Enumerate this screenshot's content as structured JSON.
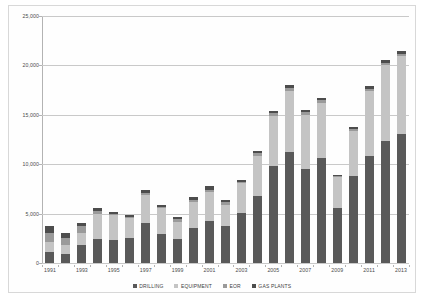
{
  "chart_data": {
    "type": "bar",
    "subtype": "stacked-column",
    "title": "",
    "subtitle": "",
    "xlabel": "",
    "ylabel": "",
    "ylim": [
      0,
      25000
    ],
    "ytick_labels": [
      "0",
      "5,000",
      "10,000",
      "15,000",
      "20,000",
      "25,000"
    ],
    "ytick_values": [
      0,
      5000,
      10000,
      15000,
      20000,
      25000
    ],
    "grid": true,
    "legend_position": "bottom",
    "categories": [
      "1991",
      "1992",
      "1993",
      "1994",
      "1995",
      "1996",
      "1997",
      "1998",
      "1999",
      "2000",
      "2001",
      "2002",
      "2003",
      "2004",
      "2005",
      "2006",
      "2007",
      "2008",
      "2009",
      "2010",
      "2011",
      "2012",
      "2013"
    ],
    "xtick_labels_shown": [
      "1991",
      "1993",
      "1995",
      "1997",
      "1999",
      "2001",
      "2003",
      "2005",
      "2007",
      "2009",
      "2011",
      "2013"
    ],
    "series": [
      {
        "name": "DRILLING",
        "color": "#595959",
        "values": [
          1100,
          900,
          1800,
          2400,
          2300,
          2500,
          4100,
          2900,
          2450,
          3500,
          4300,
          3700,
          5100,
          6800,
          9800,
          11200,
          9500,
          10600,
          5600,
          8800,
          10800,
          12300,
          13100
        ]
      },
      {
        "name": "EQUIPMENT",
        "color": "#c4c4c4",
        "values": [
          1000,
          900,
          1200,
          2600,
          2600,
          2100,
          2800,
          2700,
          1750,
          2700,
          2900,
          2200,
          3000,
          4000,
          5100,
          6200,
          5500,
          5600,
          3100,
          4600,
          6600,
          7700,
          7900
        ]
      },
      {
        "name": "EOR",
        "color": "#9a9a9a",
        "values": [
          900,
          700,
          700,
          300,
          100,
          100,
          200,
          100,
          250,
          200,
          200,
          250,
          100,
          300,
          250,
          300,
          300,
          300,
          100,
          200,
          200,
          200,
          200
        ]
      },
      {
        "name": "GAS PLANTS",
        "color": "#4d4d4d",
        "values": [
          700,
          500,
          400,
          300,
          200,
          200,
          300,
          200,
          250,
          300,
          350,
          250,
          200,
          200,
          250,
          300,
          200,
          200,
          100,
          200,
          300,
          300,
          300
        ]
      }
    ],
    "totals": [
      3700,
      3000,
      4100,
      5600,
      5200,
      4900,
      7400,
      5900,
      4700,
      6700,
      7750,
      6400,
      8400,
      11300,
      15400,
      18000,
      15500,
      16700,
      8900,
      13800,
      17900,
      20500,
      21500
    ]
  },
  "legend": {
    "items": [
      {
        "label": "DRILLING",
        "color": "#595959"
      },
      {
        "label": "EQUIPMENT",
        "color": "#c4c4c4"
      },
      {
        "label": "EOR",
        "color": "#9a9a9a"
      },
      {
        "label": "GAS PLANTS",
        "color": "#4d4d4d"
      }
    ]
  },
  "colors": {
    "grid": "#c9c9c9",
    "axis": "#b3b3b3",
    "border": "#d8d8d8",
    "text": "#4a4a4a",
    "background": "#ffffff"
  }
}
